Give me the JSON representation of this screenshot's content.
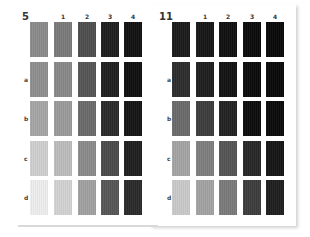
{
  "panels": [
    {
      "label": "5",
      "columns": [
        "",
        "1",
        "2",
        "3",
        "4"
      ],
      "rows": [
        "",
        "a",
        "b",
        "c",
        "d"
      ],
      "swatches": [
        [
          "#8a8a8a",
          "#7a7a7a",
          "#4e4e4e",
          "#1e1e1e",
          "#111111"
        ],
        [
          "#8e8e8e",
          "#888888",
          "#555555",
          "#1f1f1f",
          "#0f0f0f"
        ],
        [
          "#a5a5a5",
          "#9a9a9a",
          "#6a6a6a",
          "#2a2a2a",
          "#141414"
        ],
        [
          "#cfcfcf",
          "#bcbcbc",
          "#8a8a8a",
          "#4a4a4a",
          "#1f1f1f"
        ],
        [
          "#ededed",
          "#d2d2d2",
          "#a0a0a0",
          "#555555",
          "#2a2a2a"
        ]
      ]
    },
    {
      "label": "11",
      "columns": [
        "",
        "1",
        "2",
        "3",
        "4"
      ],
      "rows": [
        "",
        "a",
        "b",
        "c",
        "d"
      ],
      "swatches": [
        [
          "#1a1a1a",
          "#161616",
          "#101010",
          "#0a0a0a",
          "#080808"
        ],
        [
          "#2c2c2c",
          "#1e1e1e",
          "#121212",
          "#0a0a0a",
          "#080808"
        ],
        [
          "#6a6a6a",
          "#3c3c3c",
          "#222222",
          "#0c0c0c",
          "#090909"
        ],
        [
          "#a3a3a3",
          "#7e7e7e",
          "#545454",
          "#262626",
          "#141414"
        ],
        [
          "#c9c9c9",
          "#a2a2a2",
          "#7a7a7a",
          "#3c3c3c",
          "#1e1e1e"
        ]
      ]
    }
  ]
}
